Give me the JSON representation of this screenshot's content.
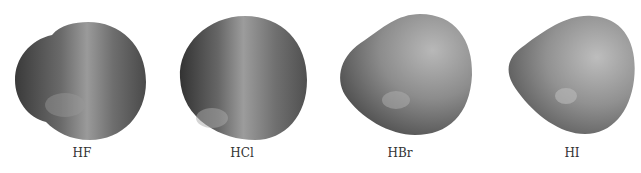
{
  "figure": {
    "molecules": [
      {
        "label": "HF"
      },
      {
        "label": "HCl"
      },
      {
        "label": "HBr"
      },
      {
        "label": "HI"
      }
    ]
  }
}
